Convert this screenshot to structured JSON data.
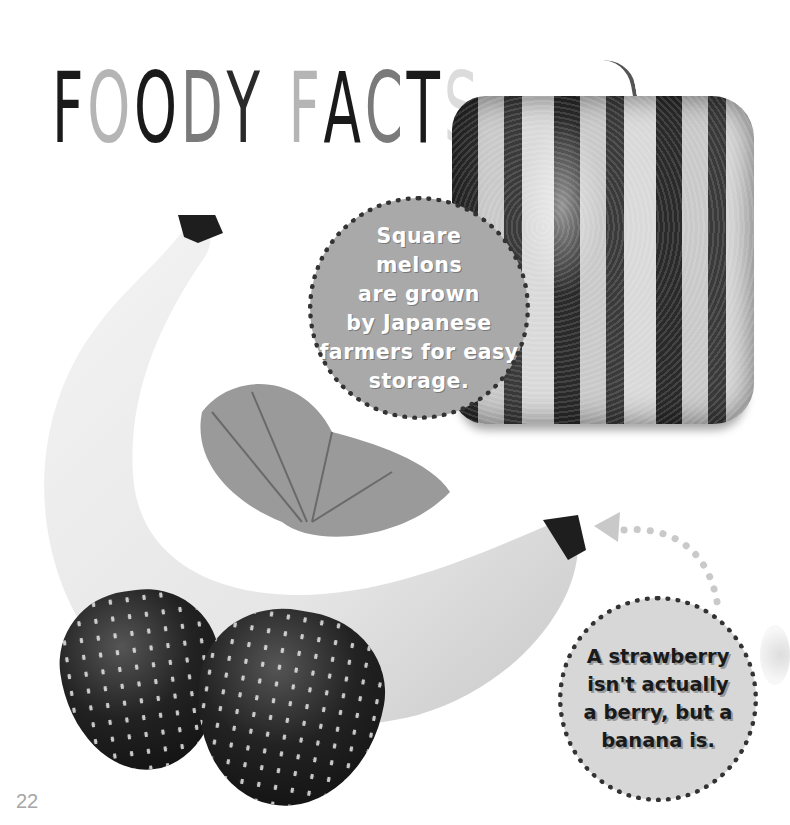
{
  "title": {
    "letters": [
      {
        "char": "F",
        "color": "#1a1a1a"
      },
      {
        "char": "O",
        "color": "#b5b5b5"
      },
      {
        "char": "O",
        "color": "#1a1a1a"
      },
      {
        "char": "D",
        "color": "#7a7a7a"
      },
      {
        "char": "Y",
        "color": "#2a2a2a"
      },
      {
        "char": " ",
        "color": "#ffffff"
      },
      {
        "char": "F",
        "color": "#b5b5b5"
      },
      {
        "char": "A",
        "color": "#1a1a1a"
      },
      {
        "char": "C",
        "color": "#7a7a7a"
      },
      {
        "char": "T",
        "color": "#1a1a1a"
      },
      {
        "char": "S",
        "color": "#dcdcdc"
      }
    ],
    "text": "FOODY FACTS"
  },
  "facts": [
    {
      "lines": [
        "Square",
        "melons",
        "are grown",
        "by Japanese",
        "farmers for easy",
        "storage."
      ],
      "bubble_color": "#a9a9a9",
      "text_color": "#ffffff"
    },
    {
      "lines": [
        "A strawberry",
        "isn't actually",
        "a berry, but a",
        "banana is."
      ],
      "bubble_color": "#d7d7d7",
      "text_color": "#1a1a1a"
    }
  ],
  "images": {
    "melon": "square-watermelon",
    "banana": "banana",
    "leaf": "strawberry-leaf",
    "strawberries": "two-strawberries"
  },
  "page_number": "22"
}
